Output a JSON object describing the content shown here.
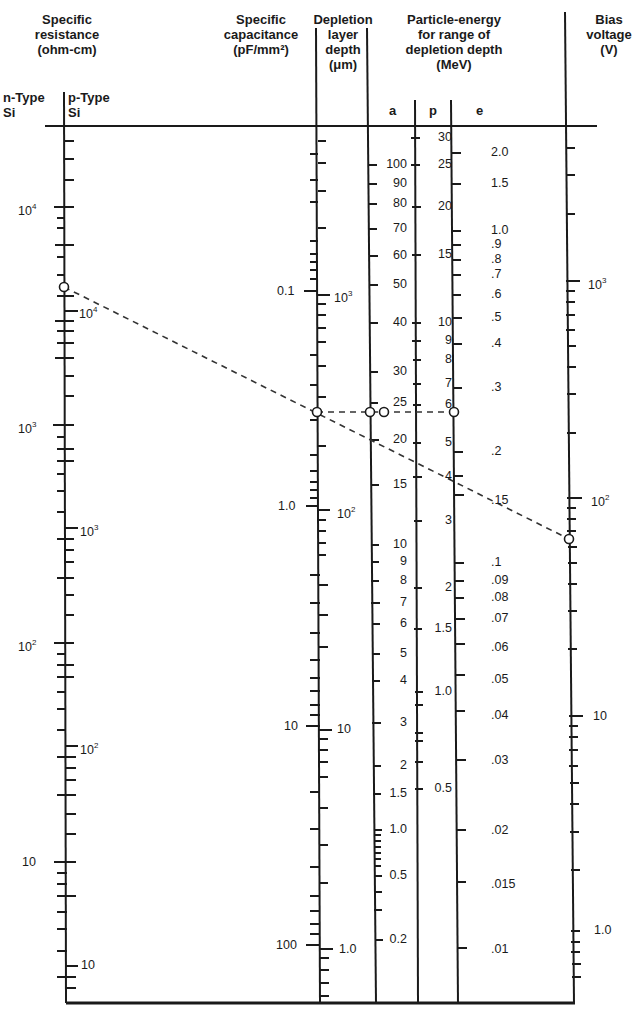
{
  "headers": {
    "resistance": [
      "Specific",
      "resistance",
      "(ohm-cm)"
    ],
    "capacitance": [
      "Specific",
      "capacitance",
      "(pF/mm²)"
    ],
    "depletion": [
      "Depletion",
      "layer",
      "depth",
      "(μm)"
    ],
    "particle": [
      "Particle-energy",
      "for range of",
      "depletion depth",
      "(MeV)"
    ],
    "bias": [
      "Bias",
      "voltage",
      "(V)"
    ]
  },
  "subheaders": {
    "n_type": [
      "n-Type",
      "Si"
    ],
    "p_type": [
      "p-Type",
      "Si"
    ],
    "a": "a",
    "p": "p",
    "e": "e"
  },
  "chart_data": {
    "type": "nomogram",
    "axes": [
      {
        "name": "Specific resistance n-Type Si (ohm-cm)",
        "scale": "log",
        "labels": [
          {
            "text": "10^4",
            "y": 207
          },
          {
            "text": "10^3",
            "y": 425
          },
          {
            "text": "10^2",
            "y": 643
          },
          {
            "text": "10",
            "y": 862
          }
        ]
      },
      {
        "name": "Specific resistance p-Type Si (ohm-cm)",
        "scale": "log",
        "labels": [
          {
            "text": "10^4",
            "y": 311
          },
          {
            "text": "10^3",
            "y": 528
          },
          {
            "text": "10^2",
            "y": 746
          },
          {
            "text": "10",
            "y": 965
          }
        ]
      },
      {
        "name": "Specific capacitance (pF/mm²)",
        "scale": "log",
        "labels": [
          {
            "text": "0.1",
            "y": 291
          },
          {
            "text": "1.0",
            "y": 506
          },
          {
            "text": "10",
            "y": 726
          },
          {
            "text": "100",
            "y": 945
          }
        ]
      },
      {
        "name": "Depletion layer depth (μm)",
        "scale": "log",
        "labels": [
          {
            "text": "10^3",
            "y": 293
          },
          {
            "text": "10^2",
            "y": 510
          },
          {
            "text": "10",
            "y": 730
          },
          {
            "text": "1.0",
            "y": 949
          }
        ]
      },
      {
        "name": "Particle energy a (alpha) (MeV)",
        "labels": [
          {
            "text": "100",
            "y": 165
          },
          {
            "text": "90",
            "y": 184
          },
          {
            "text": "80",
            "y": 204
          },
          {
            "text": "70",
            "y": 229
          },
          {
            "text": "60",
            "y": 256
          },
          {
            "text": "50",
            "y": 285
          },
          {
            "text": "40",
            "y": 323
          },
          {
            "text": "30",
            "y": 372
          },
          {
            "text": "25",
            "y": 403
          },
          {
            "text": "20",
            "y": 440
          },
          {
            "text": "15",
            "y": 485
          },
          {
            "text": "10",
            "y": 545
          },
          {
            "text": "9",
            "y": 562
          },
          {
            "text": "8",
            "y": 581
          },
          {
            "text": "7",
            "y": 603
          },
          {
            "text": "6",
            "y": 624
          },
          {
            "text": "5",
            "y": 654
          },
          {
            "text": "4",
            "y": 681
          },
          {
            "text": "3",
            "y": 723
          },
          {
            "text": "2",
            "y": 766
          },
          {
            "text": "1.5",
            "y": 794
          },
          {
            "text": "1.0",
            "y": 830
          },
          {
            "text": "0.5",
            "y": 876
          },
          {
            "text": "0.2",
            "y": 940
          }
        ]
      },
      {
        "name": "Particle energy p (proton) (MeV)",
        "labels": [
          {
            "text": "30",
            "y": 138
          },
          {
            "text": "25",
            "y": 165
          },
          {
            "text": "20",
            "y": 207
          },
          {
            "text": "15",
            "y": 255
          },
          {
            "text": "10",
            "y": 323
          },
          {
            "text": "9",
            "y": 341
          },
          {
            "text": "8",
            "y": 360
          },
          {
            "text": "7",
            "y": 384
          },
          {
            "text": "6",
            "y": 405
          },
          {
            "text": "5",
            "y": 443
          },
          {
            "text": "4",
            "y": 477
          },
          {
            "text": "3",
            "y": 521
          },
          {
            "text": "2",
            "y": 588
          },
          {
            "text": "1.5",
            "y": 629
          },
          {
            "text": "1.0",
            "y": 692
          },
          {
            "text": "0.5",
            "y": 789
          }
        ]
      },
      {
        "name": "Particle energy e (electron) (MeV)",
        "labels": [
          {
            "text": "2.0",
            "y": 153
          },
          {
            "text": "1.5",
            "y": 184
          },
          {
            "text": "1.0",
            "y": 231
          },
          {
            "text": ".9",
            "y": 245
          },
          {
            "text": ".8",
            "y": 260
          },
          {
            "text": ".7",
            "y": 275
          },
          {
            "text": ".6",
            "y": 295
          },
          {
            "text": ".5",
            "y": 318
          },
          {
            "text": ".4",
            "y": 344
          },
          {
            "text": ".3",
            "y": 388
          },
          {
            "text": ".2",
            "y": 452
          },
          {
            "text": ".15",
            "y": 501
          },
          {
            "text": ".1",
            "y": 563
          },
          {
            "text": ".09",
            "y": 581
          },
          {
            "text": ".08",
            "y": 598
          },
          {
            "text": ".07",
            "y": 619
          },
          {
            "text": ".06",
            "y": 648
          },
          {
            "text": ".05",
            "y": 680
          },
          {
            "text": ".04",
            "y": 716
          },
          {
            "text": ".03",
            "y": 761
          },
          {
            "text": ".02",
            "y": 831
          },
          {
            "text": ".015",
            "y": 885
          },
          {
            "text": ".01",
            "y": 950
          }
        ]
      },
      {
        "name": "Bias voltage (V)",
        "scale": "log",
        "labels": [
          {
            "text": "10^3",
            "y": 281
          },
          {
            "text": "10^2",
            "y": 498
          },
          {
            "text": "10",
            "y": 716
          },
          {
            "text": "1.0",
            "y": 930
          }
        ]
      }
    ],
    "example_line": {
      "description": "Dashed isopleth from n-type resistivity ≈ 4.5×10^3 ohm-cm to bias voltage ≈ 60 V, crossing depletion depth ≈ 220 μm; horizontal dashed line reads particle energies a≈24 MeV, p≈6 MeV, e≈0.25 MeV",
      "points": [
        {
          "axis": "resistance_n",
          "x": 64,
          "y": 287
        },
        {
          "axis": "capacitance/depletion",
          "x": 317,
          "y": 412
        },
        {
          "axis": "bias",
          "x": 569,
          "y": 539
        }
      ],
      "horizontal_points": [
        {
          "axis": "depletion",
          "x": 317,
          "y": 412
        },
        {
          "axis": "a",
          "x": 370,
          "y": 412
        },
        {
          "axis": "p",
          "x": 384,
          "y": 412
        },
        {
          "axis": "e",
          "x": 454,
          "y": 412
        }
      ]
    }
  }
}
